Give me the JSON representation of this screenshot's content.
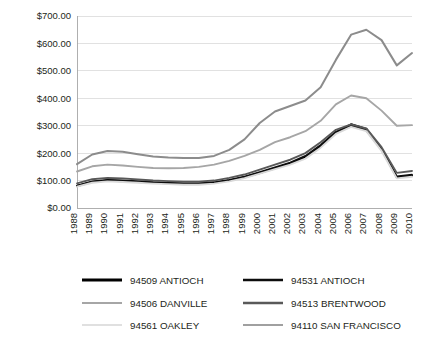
{
  "chart_data": {
    "type": "line",
    "title": "",
    "subtitle": "",
    "xlabel": "",
    "ylabel": "",
    "grid": true,
    "legend_position": "bottom",
    "ylim": [
      0,
      700
    ],
    "ytick_values": [
      0,
      100,
      200,
      300,
      400,
      500,
      600,
      700
    ],
    "ytick_labels": [
      "$0.00",
      "$100.00",
      "$200.00",
      "$300.00",
      "$400.00",
      "$500.00",
      "$600.00",
      "$700.00"
    ],
    "categories": [
      "1988",
      "1989",
      "1990",
      "1991",
      "1992",
      "1993",
      "1994",
      "1995",
      "1996",
      "1997",
      "1998",
      "1999",
      "2000",
      "2001",
      "2002",
      "2003",
      "2004",
      "2005",
      "2006",
      "2007",
      "2008",
      "2009",
      "2010"
    ],
    "series": [
      {
        "name": "94509 ANTIOCH",
        "color": "#000000",
        "width": 2.1,
        "values": [
          80,
          95,
          100,
          98,
          95,
          92,
          90,
          88,
          88,
          92,
          100,
          112,
          128,
          145,
          162,
          185,
          225,
          275,
          305,
          288,
          215,
          112,
          118
        ]
      },
      {
        "name": "94531 ANTIOCH",
        "color": "#0d0d0d",
        "width": 1.7,
        "values": [
          82,
          97,
          103,
          101,
          98,
          94,
          92,
          90,
          90,
          94,
          103,
          115,
          131,
          148,
          166,
          190,
          230,
          278,
          300,
          283,
          212,
          115,
          122
        ]
      },
      {
        "name": "94506 DANVILLE",
        "color": "#a6a6a6",
        "width": 1.9,
        "values": [
          133,
          152,
          158,
          155,
          150,
          146,
          145,
          146,
          150,
          158,
          172,
          190,
          212,
          240,
          258,
          280,
          318,
          378,
          410,
          400,
          355,
          300,
          302
        ]
      },
      {
        "name": "94513 BRENTWOOD",
        "color": "#595959",
        "width": 1.9,
        "values": [
          90,
          105,
          110,
          108,
          104,
          100,
          98,
          96,
          96,
          100,
          110,
          122,
          140,
          158,
          176,
          200,
          240,
          285,
          305,
          290,
          222,
          128,
          135
        ]
      },
      {
        "name": "94561 OAKLEY",
        "color": "#d9d9d9",
        "width": 1.9,
        "values": [
          78,
          92,
          97,
          95,
          92,
          89,
          87,
          85,
          85,
          89,
          97,
          109,
          125,
          142,
          158,
          180,
          220,
          270,
          296,
          280,
          208,
          108,
          114
        ]
      },
      {
        "name": "94110 SAN FRANCISCO",
        "color": "#8c8c8c",
        "width": 2.0,
        "values": [
          160,
          195,
          208,
          205,
          196,
          188,
          184,
          182,
          182,
          190,
          212,
          250,
          310,
          352,
          372,
          392,
          440,
          540,
          632,
          650,
          612,
          520,
          565
        ]
      }
    ]
  },
  "legend": {
    "entries": [
      {
        "label": "94509 ANTIOCH",
        "color": "#000000",
        "width": 3.0
      },
      {
        "label": "94531 ANTIOCH",
        "color": "#0d0d0d",
        "width": 2.6
      },
      {
        "label": "94506 DANVILLE",
        "color": "#a6a6a6",
        "width": 2.2
      },
      {
        "label": "94513 BRENTWOOD",
        "color": "#595959",
        "width": 2.6
      },
      {
        "label": "94561 OAKLEY",
        "color": "#e0e0e0",
        "width": 2.2
      },
      {
        "label": "94110 SAN FRANCISCO",
        "color": "#a0a0a0",
        "width": 2.2
      }
    ]
  },
  "colors": {
    "background": "#ffffff",
    "gridline": "#d9d9d9",
    "axis": "#a6a6a6",
    "text": "#231f20"
  }
}
